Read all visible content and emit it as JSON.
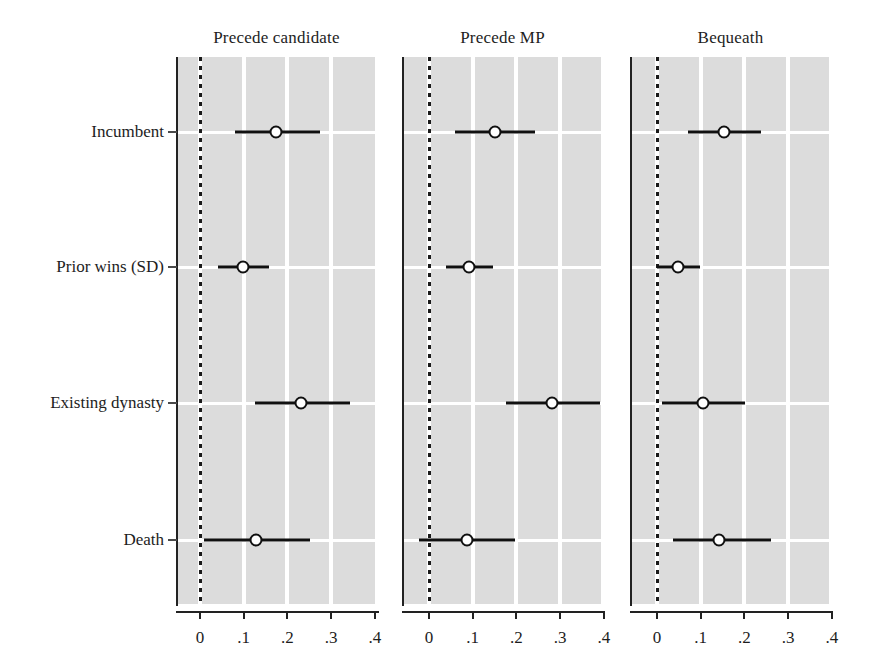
{
  "chart_data": {
    "type": "scatter",
    "title": "",
    "subtitle": "",
    "xlabel": "",
    "ylabel": "",
    "xlim": [
      -0.035,
      0.44
    ],
    "xticks": [
      0,
      0.1,
      0.2,
      0.3,
      0.4
    ],
    "xtick_labels": [
      "0",
      ".1",
      ".2",
      ".3",
      ".4"
    ],
    "categories": [
      "Incumbent",
      "Prior wins (SD)",
      "Existing dynasty",
      "Death"
    ],
    "grid": true,
    "legend": "none",
    "annotations": [
      "dotted vertical reference line at x = 0 in each panel"
    ],
    "panels": [
      {
        "label": "Precede candidate",
        "points": [
          {
            "category": "Incumbent",
            "estimate": 0.175,
            "ci_low": 0.08,
            "ci_high": 0.275
          },
          {
            "category": "Prior wins (SD)",
            "estimate": 0.098,
            "ci_low": 0.042,
            "ci_high": 0.158
          },
          {
            "category": "Existing dynasty",
            "estimate": 0.231,
            "ci_low": 0.126,
            "ci_high": 0.343
          },
          {
            "category": "Death",
            "estimate": 0.128,
            "ci_low": 0.01,
            "ci_high": 0.252
          }
        ]
      },
      {
        "label": "Precede MP",
        "points": [
          {
            "category": "Incumbent",
            "estimate": 0.151,
            "ci_low": 0.06,
            "ci_high": 0.243
          },
          {
            "category": "Prior wins (SD)",
            "estimate": 0.092,
            "ci_low": 0.039,
            "ci_high": 0.147
          },
          {
            "category": "Existing dynasty",
            "estimate": 0.281,
            "ci_low": 0.176,
            "ci_high": 0.391
          },
          {
            "category": "Death",
            "estimate": 0.087,
            "ci_low": -0.023,
            "ci_high": 0.197
          }
        ]
      },
      {
        "label": "Bequeath",
        "points": [
          {
            "category": "Incumbent",
            "estimate": 0.153,
            "ci_low": 0.071,
            "ci_high": 0.238
          },
          {
            "category": "Prior wins (SD)",
            "estimate": 0.048,
            "ci_low": 0.0,
            "ci_high": 0.098
          },
          {
            "category": "Existing dynasty",
            "estimate": 0.105,
            "ci_low": 0.011,
            "ci_high": 0.201
          },
          {
            "category": "Death",
            "estimate": 0.142,
            "ci_low": 0.037,
            "ci_high": 0.261
          }
        ]
      }
    ],
    "colors": {
      "panel_background": "#dcdcdc",
      "gridline": "#ffffff",
      "marker_edge": "#101010",
      "marker_fill": "#ffffff",
      "ci_line": "#101010",
      "zero_line": "#1a1a1a",
      "axis": "#222222",
      "text": "#1d1d1d"
    }
  }
}
